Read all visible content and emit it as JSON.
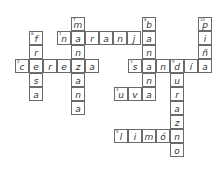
{
  "puzzle": {
    "type": "crossword",
    "cell_size": 14,
    "cells": [
      {
        "x": 71,
        "y": 17,
        "l": "m",
        "n": "7"
      },
      {
        "x": 142,
        "y": 17,
        "l": "b",
        "n": "8"
      },
      {
        "x": 198,
        "y": 17,
        "l": "p",
        "n": "10"
      },
      {
        "x": 29,
        "y": 31,
        "l": "f",
        "n": "6"
      },
      {
        "x": 57,
        "y": 31,
        "l": "n",
        "n": "1"
      },
      {
        "x": 71,
        "y": 31,
        "l": "a"
      },
      {
        "x": 85,
        "y": 31,
        "l": "r"
      },
      {
        "x": 99,
        "y": 31,
        "l": "a"
      },
      {
        "x": 113,
        "y": 31,
        "l": "n"
      },
      {
        "x": 127,
        "y": 31,
        "l": "j"
      },
      {
        "x": 142,
        "y": 31,
        "l": "a"
      },
      {
        "x": 198,
        "y": 31,
        "l": "i"
      },
      {
        "x": 29,
        "y": 45,
        "l": "r"
      },
      {
        "x": 71,
        "y": 45,
        "l": "n"
      },
      {
        "x": 142,
        "y": 45,
        "l": "n"
      },
      {
        "x": 198,
        "y": 45,
        "l": "ñ"
      },
      {
        "x": 15,
        "y": 59,
        "l": "c",
        "n": "2"
      },
      {
        "x": 29,
        "y": 59,
        "l": "e"
      },
      {
        "x": 43,
        "y": 59,
        "l": "r"
      },
      {
        "x": 57,
        "y": 59,
        "l": "e"
      },
      {
        "x": 71,
        "y": 59,
        "l": "z"
      },
      {
        "x": 85,
        "y": 59,
        "l": "a"
      },
      {
        "x": 128,
        "y": 59,
        "l": "s",
        "n": "3"
      },
      {
        "x": 142,
        "y": 59,
        "l": "a"
      },
      {
        "x": 156,
        "y": 59,
        "l": "n"
      },
      {
        "x": 170,
        "y": 59,
        "l": "d",
        "n": "9"
      },
      {
        "x": 184,
        "y": 59,
        "l": "í"
      },
      {
        "x": 198,
        "y": 59,
        "l": "a"
      },
      {
        "x": 29,
        "y": 73,
        "l": "s"
      },
      {
        "x": 71,
        "y": 73,
        "l": "a"
      },
      {
        "x": 142,
        "y": 73,
        "l": "n"
      },
      {
        "x": 170,
        "y": 73,
        "l": "u"
      },
      {
        "x": 29,
        "y": 87,
        "l": "a"
      },
      {
        "x": 71,
        "y": 87,
        "l": "n"
      },
      {
        "x": 114,
        "y": 87,
        "l": "u",
        "n": "4"
      },
      {
        "x": 128,
        "y": 87,
        "l": "v"
      },
      {
        "x": 142,
        "y": 87,
        "l": "a"
      },
      {
        "x": 170,
        "y": 87,
        "l": "r"
      },
      {
        "x": 71,
        "y": 101,
        "l": "a"
      },
      {
        "x": 170,
        "y": 101,
        "l": "a"
      },
      {
        "x": 170,
        "y": 115,
        "l": "z"
      },
      {
        "x": 114,
        "y": 129,
        "l": "l",
        "n": "5"
      },
      {
        "x": 128,
        "y": 129,
        "l": "i"
      },
      {
        "x": 142,
        "y": 129,
        "l": "m"
      },
      {
        "x": 156,
        "y": 129,
        "l": "ó"
      },
      {
        "x": 170,
        "y": 129,
        "l": "n"
      },
      {
        "x": 170,
        "y": 143,
        "l": "o"
      }
    ],
    "across": [
      {
        "n": "1",
        "answer": "naranja"
      },
      {
        "n": "2",
        "answer": "cereza"
      },
      {
        "n": "3",
        "answer": "sandía"
      },
      {
        "n": "4",
        "answer": "uva"
      },
      {
        "n": "5",
        "answer": "limón"
      }
    ],
    "down": [
      {
        "n": "6",
        "answer": "fresa"
      },
      {
        "n": "7",
        "answer": "manzana"
      },
      {
        "n": "8",
        "answer": "banana"
      },
      {
        "n": "9",
        "answer": "durazno"
      },
      {
        "n": "10",
        "answer": "piña"
      }
    ]
  }
}
